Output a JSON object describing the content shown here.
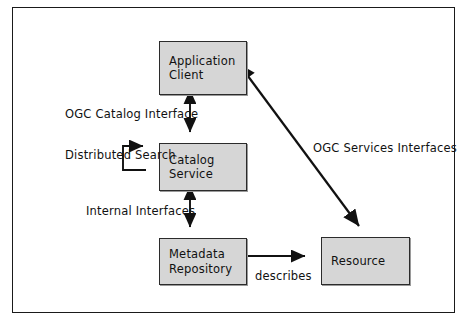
{
  "figure": {
    "type": "block-diagram",
    "colors": {
      "node_fill": "#d6d6d6",
      "node_stroke": "#2b2b2b",
      "arrow": "#111111",
      "frame": "#1a1a1a",
      "background": "#ffffff",
      "text": "#111111"
    }
  },
  "nodes": {
    "application_client": {
      "line1": "Application",
      "line2": "Client"
    },
    "catalog_service": {
      "line1": "Catalog",
      "line2": "Service"
    },
    "metadata_repository": {
      "line1": "Metadata",
      "line2": "Repository"
    },
    "resource": {
      "line1": "Resource",
      "line2": ""
    }
  },
  "labels": {
    "ogc_catalog_interface": "OGC Catalog Interface",
    "distributed_search_line1": "Distributed",
    "distributed_search_line2": "Search",
    "internal_interfaces": "Internal Interfaces",
    "ogc_services_interfaces": "OGC Services Interfaces",
    "describes": "describes"
  },
  "edges": [
    {
      "id": "client-catalog",
      "from": "application_client",
      "to": "catalog_service",
      "label": "OGC Catalog Interface",
      "arrowheads": "both",
      "style": "vertical"
    },
    {
      "id": "catalog-self-loop",
      "from": "catalog_service",
      "to": "catalog_service",
      "label": "Distributed Search",
      "arrowheads": "end",
      "style": "self-loop-left"
    },
    {
      "id": "catalog-metadata",
      "from": "catalog_service",
      "to": "metadata_repository",
      "label": "Internal Interfaces",
      "arrowheads": "both",
      "style": "vertical"
    },
    {
      "id": "metadata-resource",
      "from": "metadata_repository",
      "to": "resource",
      "label": "describes",
      "arrowheads": "end",
      "style": "horizontal"
    },
    {
      "id": "client-resource",
      "from": "application_client",
      "to": "resource",
      "label": "OGC Services Interfaces",
      "arrowheads": "both",
      "style": "diagonal"
    }
  ]
}
